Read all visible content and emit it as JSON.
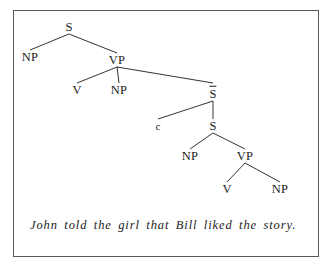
{
  "figure": {
    "type": "syntax-tree-diagram",
    "border_color": "#5a5a5a",
    "background": "#ffffff",
    "ink_color": "#1c1c1c"
  },
  "sentence": {
    "text": "John told the girl that Bill liked the story.",
    "style": "italic"
  },
  "tree": {
    "nodes": [
      {
        "id": "s-root",
        "label": "S",
        "x": 69,
        "y": 27,
        "overbar": false,
        "size": "normal"
      },
      {
        "id": "np-subj",
        "label": "NP",
        "x": 30,
        "y": 57,
        "overbar": false,
        "size": "normal"
      },
      {
        "id": "vp-main",
        "label": "VP",
        "x": 117,
        "y": 60,
        "overbar": false,
        "size": "normal"
      },
      {
        "id": "v-main",
        "label": "V",
        "x": 77,
        "y": 90,
        "overbar": false,
        "size": "normal"
      },
      {
        "id": "np-obj",
        "label": "NP",
        "x": 119,
        "y": 90,
        "overbar": false,
        "size": "normal"
      },
      {
        "id": "s-bar",
        "label": "S",
        "x": 213,
        "y": 93,
        "overbar": true,
        "size": "normal"
      },
      {
        "id": "c-comp",
        "label": "c",
        "x": 158,
        "y": 126,
        "overbar": false,
        "size": "small"
      },
      {
        "id": "s-embed",
        "label": "S",
        "x": 213,
        "y": 126,
        "overbar": false,
        "size": "normal"
      },
      {
        "id": "np-emb",
        "label": "NP",
        "x": 190,
        "y": 156,
        "overbar": false,
        "size": "normal"
      },
      {
        "id": "vp-emb",
        "label": "VP",
        "x": 245,
        "y": 156,
        "overbar": false,
        "size": "normal"
      },
      {
        "id": "v-emb",
        "label": "V",
        "x": 227,
        "y": 189,
        "overbar": false,
        "size": "normal"
      },
      {
        "id": "np-emb2",
        "label": "NP",
        "x": 280,
        "y": 189,
        "overbar": false,
        "size": "normal"
      }
    ],
    "edges": [
      {
        "from": "s-root",
        "to": "np-subj"
      },
      {
        "from": "s-root",
        "to": "vp-main"
      },
      {
        "from": "vp-main",
        "to": "v-main"
      },
      {
        "from": "vp-main",
        "to": "np-obj"
      },
      {
        "from": "vp-main",
        "to": "s-bar"
      },
      {
        "from": "s-bar",
        "to": "c-comp"
      },
      {
        "from": "s-bar",
        "to": "s-embed"
      },
      {
        "from": "s-embed",
        "to": "np-emb"
      },
      {
        "from": "s-embed",
        "to": "vp-emb"
      },
      {
        "from": "vp-emb",
        "to": "v-emb"
      },
      {
        "from": "vp-emb",
        "to": "np-emb2"
      }
    ]
  }
}
